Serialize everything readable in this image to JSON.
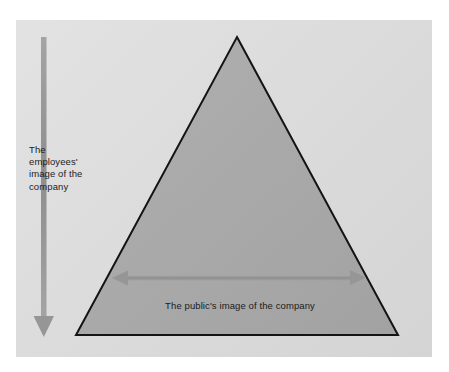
{
  "figure": {
    "type": "pyramid-diagram",
    "panel": {
      "background_color": "#dcdcdc"
    },
    "shape": {
      "name": "triangle",
      "fill_color": "#a8a8a8",
      "stroke_color": "#141414",
      "apex": {
        "x": 237,
        "y": 37
      },
      "base_left": {
        "x": 76,
        "y": 335
      },
      "base_right": {
        "x": 398,
        "y": 335
      }
    },
    "vertical_arrow": {
      "label": "The employees' image of the company",
      "direction": "down",
      "color": "#969696",
      "from": {
        "x": 44,
        "y": 37
      },
      "to": {
        "x": 44,
        "y": 337
      }
    },
    "horizontal_arrow": {
      "label": "The public's image of the company",
      "direction": "both",
      "color": "#969696",
      "from": {
        "x": 112,
        "y": 278
      },
      "to": {
        "x": 366,
        "y": 278
      }
    },
    "labels": {
      "employees_line_1": "The",
      "employees_line_2": "employees'",
      "employees_line_3": "image of the",
      "employees_line_4": "company",
      "public": "The public's image of the company"
    }
  }
}
